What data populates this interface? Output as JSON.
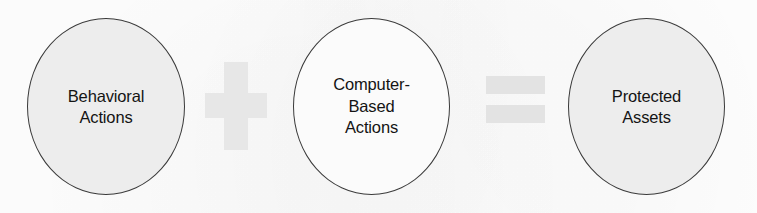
{
  "diagram": {
    "type": "conceptual-equation",
    "background_color": "#ffffff",
    "nodes": [
      {
        "id": "behavioral-actions",
        "shape": "circle",
        "label": "Behavioral\nActions",
        "lines": [
          "Behavioral",
          "Actions"
        ],
        "fill_color": "#ededed",
        "border_color": "#3a3a3a",
        "text_color": "#141414"
      },
      {
        "id": "computer-based-actions",
        "shape": "circle",
        "label": "Computer-\nBased\nActions",
        "lines": [
          "Computer-",
          "Based",
          "Actions"
        ],
        "fill_color": "#fbfbfb",
        "border_color": "#3a3a3a",
        "text_color": "#141414"
      },
      {
        "id": "protected-assets",
        "shape": "circle",
        "label": "Protected\nAssets",
        "lines": [
          "Protected",
          "Assets"
        ],
        "fill_color": "#ededed",
        "border_color": "#3a3a3a",
        "text_color": "#141414"
      }
    ],
    "operators": [
      {
        "id": "plus",
        "symbol": "+",
        "name": "plus-sign",
        "color": "#e7e7e7"
      },
      {
        "id": "equals",
        "symbol": "=",
        "name": "equals-sign",
        "color": "#e3e3e3"
      }
    ]
  }
}
